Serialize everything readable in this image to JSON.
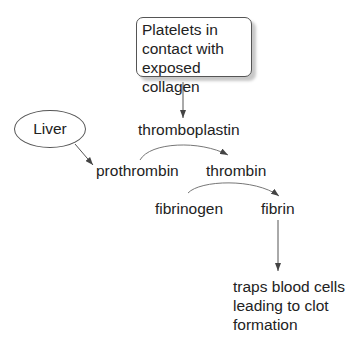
{
  "diagram": {
    "type": "flowchart",
    "topic": "blood clotting cascade",
    "nodes": {
      "platelets": "Platelets in contact with exposed collagen",
      "platelets_lines": [
        "Platelets in",
        "contact with",
        "exposed collagen"
      ],
      "liver": "Liver",
      "thromboplastin": "thromboplastin",
      "prothrombin": "prothrombin",
      "thrombin": "thrombin",
      "fibrinogen": "fibrinogen",
      "fibrin": "fibrin",
      "outcome": "traps blood cells leading to clot formation",
      "outcome_lines": [
        "traps blood cells",
        "leading to clot",
        "formation"
      ]
    },
    "edges": [
      {
        "from": "platelets",
        "to": "thromboplastin",
        "style": "arrow"
      },
      {
        "from": "liver",
        "to": "prothrombin",
        "style": "arrow"
      },
      {
        "from": "prothrombin",
        "to": "thrombin",
        "style": "curved-arrow",
        "catalyst": "thromboplastin"
      },
      {
        "from": "fibrinogen",
        "to": "fibrin",
        "style": "curved-arrow",
        "catalyst": "thrombin"
      },
      {
        "from": "fibrin",
        "to": "outcome",
        "style": "arrow"
      }
    ],
    "colors": {
      "line": "#555555",
      "text": "#222222",
      "shadow": "#c8c8c8"
    }
  }
}
